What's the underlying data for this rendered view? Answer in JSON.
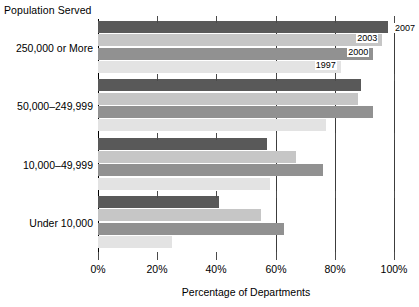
{
  "chart_data": {
    "type": "bar",
    "orientation": "horizontal",
    "title": "",
    "axis_group_title": "Population Served",
    "xlabel": "Percentage of Departments",
    "ylabel": "Population Served",
    "xlim": [
      0,
      100
    ],
    "xticks": [
      0,
      20,
      40,
      60,
      80,
      100
    ],
    "xticklabels": [
      "0%",
      "20%",
      "40%",
      "60%",
      "80%",
      "100%"
    ],
    "gridlines": [
      60,
      80,
      100
    ],
    "grid": true,
    "legend_position": "inline-bar-end-labels",
    "categories": [
      "250,000 or More",
      "50,000–249,999",
      "10,000–49,999",
      "Under 10,000"
    ],
    "series": [
      {
        "name": "2007",
        "color": "#595959",
        "values": [
          98,
          89,
          57,
          41
        ]
      },
      {
        "name": "2003",
        "color": "#c6c6c6",
        "values": [
          96,
          88,
          67,
          55
        ]
      },
      {
        "name": "2000",
        "color": "#919191",
        "values": [
          93,
          93,
          76,
          63
        ]
      },
      {
        "name": "1997",
        "color": "#e3e3e3",
        "values": [
          82,
          77,
          58,
          25
        ]
      }
    ],
    "year_callouts": [
      {
        "label": "2007",
        "series": "2007"
      },
      {
        "label": "2003",
        "series": "2003"
      },
      {
        "label": "2000",
        "series": "2000"
      },
      {
        "label": "1997",
        "series": "1997"
      }
    ]
  }
}
